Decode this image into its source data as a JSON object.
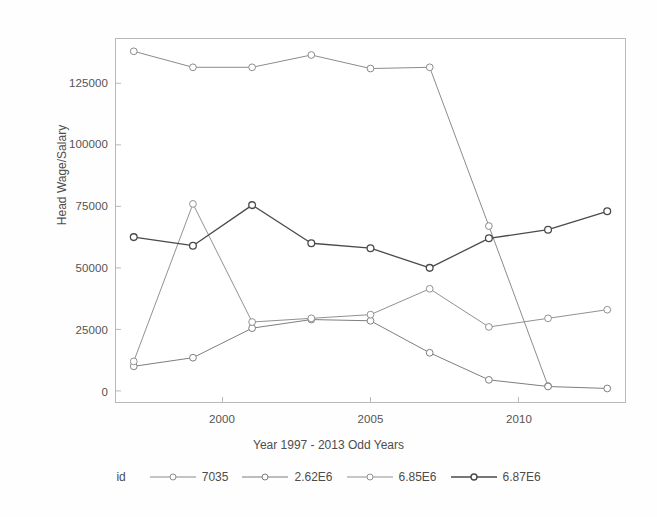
{
  "chart_data": {
    "type": "line",
    "title": "",
    "xlabel": "Year 1997 - 2013 Odd Years",
    "ylabel": "Head Wage/Salary",
    "x": [
      1997,
      1999,
      2001,
      2003,
      2005,
      2007,
      2009,
      2011,
      2013
    ],
    "xlim": [
      1996.4,
      2013.6
    ],
    "ylim": [
      -4500,
      143000
    ],
    "xticks": [
      2000,
      2005,
      2010
    ],
    "xtick_labels": [
      "2000",
      "2005",
      "2010"
    ],
    "yticks": [
      0,
      25000,
      50000,
      75000,
      100000,
      125000
    ],
    "ytick_labels": [
      "0",
      "25000",
      "50000",
      "75000",
      "100000",
      "125000"
    ],
    "grid": false,
    "legend_position": "bottom",
    "legend_title": "id",
    "marker": "circle-open",
    "series": [
      {
        "name": "7035",
        "color": "#8a8a8a",
        "x": [
          1997,
          1999,
          2001,
          2003,
          2005,
          2007,
          2009,
          2011
        ],
        "values": [
          138000,
          131500,
          131500,
          136500,
          131000,
          131500,
          67000,
          2000
        ]
      },
      {
        "name": "2.62E6",
        "color": "#7d7d7d",
        "x": [
          1997,
          1999,
          2001,
          2003,
          2005,
          2007,
          2009,
          2011,
          2013
        ],
        "values": [
          10000,
          13500,
          25500,
          29000,
          28500,
          15500,
          4500,
          1800,
          1000
        ]
      },
      {
        "name": "6.85E6",
        "color": "#909090",
        "x": [
          1997,
          1999,
          2001,
          2003,
          2005,
          2007,
          2009,
          2011,
          2013
        ],
        "values": [
          12000,
          76000,
          28000,
          29500,
          31000,
          41500,
          26000,
          29500,
          33000
        ]
      },
      {
        "name": "6.87E6",
        "color": "#4a4a4a",
        "x": [
          1997,
          1999,
          2001,
          2003,
          2005,
          2007,
          2009,
          2011,
          2013
        ],
        "values": [
          62500,
          59000,
          75500,
          60000,
          58000,
          50000,
          62000,
          65500,
          73000
        ]
      }
    ]
  },
  "axes": {
    "y_title": "Head Wage/Salary",
    "x_title": "Year 1997 - 2013 Odd Years"
  },
  "legend": {
    "title": "id",
    "items": [
      {
        "label": "7035"
      },
      {
        "label": "2.62E6"
      },
      {
        "label": "6.85E6"
      },
      {
        "label": "6.87E6"
      }
    ]
  }
}
